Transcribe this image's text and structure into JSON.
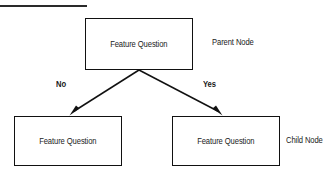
{
  "diagram": {
    "title_rule": "",
    "background_color": "#ffffff",
    "stroke_color": "#111111",
    "text_color": "#1a1a1a",
    "nodes": [
      {
        "id": "parent",
        "label": "Feature Question",
        "role": "Parent Node"
      },
      {
        "id": "child_left",
        "label": "Feature Question",
        "role": ""
      },
      {
        "id": "child_right",
        "label": "Feature Question",
        "role": "Child Node"
      }
    ],
    "annotations": {
      "parent_node": "Parent Node",
      "child_node": "Child Node"
    },
    "edges": [
      {
        "from": "parent",
        "to": "child_left",
        "label": "No"
      },
      {
        "from": "parent",
        "to": "child_right",
        "label": "Yes"
      }
    ],
    "edge_labels": {
      "left": "No",
      "right": "Yes"
    }
  }
}
